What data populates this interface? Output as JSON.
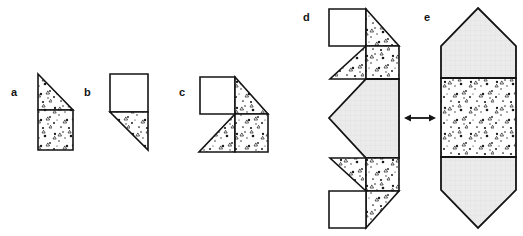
{
  "figure": {
    "background_color": "#ffffff",
    "stroke_color": "#141414",
    "fill_white": "#ffffff",
    "fill_gray": "#e8e8e8",
    "fill_stipple_base": "#ffffff",
    "stipple_dot_color": "#1a1a1a",
    "panels": [
      {
        "id": "a",
        "label": "a",
        "label_x": 11,
        "label_y": 87,
        "description": "Right triangle stacked on top of a square, both stippled",
        "parts": [
          {
            "name": "triangle-top",
            "fill": "stipple",
            "points": "38,74 73,110 38,110"
          },
          {
            "name": "square-bottom",
            "fill": "stipple",
            "points": "38,110 73,110 73,150 38,150"
          }
        ]
      },
      {
        "id": "b",
        "label": "b",
        "label_x": 84,
        "label_y": 87,
        "description": "White square on top with a stippled right triangle below pointing down-right",
        "parts": [
          {
            "name": "square-top",
            "fill": "white",
            "points": "110,74 148,74 148,112 110,112"
          },
          {
            "name": "triangle-bottom",
            "fill": "stipple",
            "points": "110,112 148,112 148,150"
          }
        ]
      },
      {
        "id": "c",
        "label": "c",
        "label_x": 179,
        "label_y": 87,
        "description": "Two-by-two composite: white square top-left, stippled triangle top-right, stippled triangle bottom-left, stippled square bottom-right",
        "parts": [
          {
            "name": "square-top-left",
            "fill": "white",
            "points": "200,77 235,77 235,114 200,114"
          },
          {
            "name": "triangle-top-right",
            "fill": "stipple",
            "points": "235,77 268,114 235,114"
          },
          {
            "name": "triangle-bottom-left",
            "fill": "stipple",
            "points": "235,114 235,152 199,152"
          },
          {
            "name": "square-bottom-right",
            "fill": "stipple",
            "points": "235,114 268,114 268,152 235,152"
          }
        ]
      },
      {
        "id": "d",
        "label": "d",
        "label_x": 303,
        "label_y": 12,
        "description": "Unfolded net: mirrored 'c' shapes at top and bottom with a gray pentagon pointing left in the middle",
        "parts": [
          {
            "name": "square-top-left",
            "fill": "white",
            "points": "329,9 366,9 366,46 329,46"
          },
          {
            "name": "triangle-top-right",
            "fill": "stipple",
            "points": "366,9 399,46 366,46"
          },
          {
            "name": "triangle-upper-left",
            "fill": "stipple",
            "points": "366,46 366,79 330,79"
          },
          {
            "name": "square-upper-right",
            "fill": "stipple",
            "points": "366,46 399,46 399,79 366,79"
          },
          {
            "name": "pentagon-middle",
            "fill": "gray",
            "points": "366,79 399,79 399,158 366,158 329,118"
          },
          {
            "name": "triangle-lower-left",
            "fill": "stipple",
            "points": "366,158 330,158 366,191"
          },
          {
            "name": "square-lower-right",
            "fill": "stipple",
            "points": "366,158 399,158 399,191 366,191"
          },
          {
            "name": "triangle-bottom-right",
            "fill": "stipple",
            "points": "366,191 399,191 366,228"
          },
          {
            "name": "square-bottom-left",
            "fill": "white",
            "points": "329,191 366,191 366,228 329,228"
          }
        ]
      },
      {
        "id": "e",
        "label": "e",
        "label_x": 424,
        "label_y": 12,
        "description": "Assembled solid: gray pentagon pointing up, stippled rectangle in the middle, gray pentagon pointing down",
        "parts": [
          {
            "name": "pentagon-top",
            "fill": "gray",
            "points": "478,8 516,46 516,78 441,78 441,46"
          },
          {
            "name": "rectangle-middle",
            "fill": "stipple",
            "points": "441,78 516,78 516,157 441,157"
          },
          {
            "name": "pentagon-bottom",
            "fill": "gray",
            "points": "441,157 516,157 516,190 478,228 441,190"
          }
        ]
      }
    ],
    "connectors": [
      {
        "name": "double-arrow",
        "symbol": "↔",
        "x1": 404,
        "x2": 436,
        "y": 118,
        "description": "Double-headed arrow linking net d to solid e"
      }
    ]
  }
}
